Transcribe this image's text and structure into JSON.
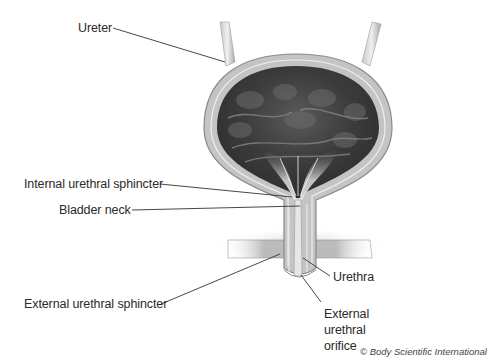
{
  "diagram": {
    "labels": [
      {
        "id": "ureter",
        "text": "Ureter"
      },
      {
        "id": "internal-urethral-sphincter",
        "text": "Internal urethral sphincter"
      },
      {
        "id": "bladder-neck",
        "text": "Bladder neck"
      },
      {
        "id": "external-urethral-sphincter",
        "text": "External urethral sphincter"
      },
      {
        "id": "urethra",
        "text": "Urethra"
      },
      {
        "id": "external-urethral-orifice",
        "lines": [
          "External",
          "urethral",
          "orifice"
        ]
      }
    ],
    "credit": "© Body Scientific International"
  },
  "colors": {
    "background": "#ffffff",
    "wall": "#bdbdbd",
    "wall_edge": "#8a8a8a",
    "lumen_dark": "#3a3a3a",
    "lumen_light": "#d8d8d8",
    "leader_line": "#333333",
    "label_text": "#2a2a2a"
  }
}
